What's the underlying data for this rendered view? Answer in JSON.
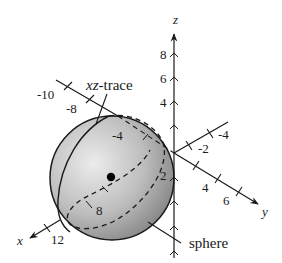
{
  "diagram": {
    "type": "3d-coordinate-sketch",
    "axes": {
      "x": {
        "label": "x",
        "ticks": [
          "-10",
          "-8",
          "-4",
          "2",
          "8",
          "12"
        ]
      },
      "y": {
        "label": "y",
        "ticks": [
          "-4",
          "-2",
          "4",
          "6"
        ]
      },
      "z": {
        "label": "z",
        "ticks": [
          "8",
          "6",
          "4"
        ]
      }
    },
    "callouts": {
      "trace": "xz-trace",
      "trace_italic": "xz",
      "trace_rest": "-trace",
      "sphere": "sphere"
    },
    "colors": {
      "sphere_light": "#e6e6e6",
      "sphere_dark": "#8a8a8a",
      "line": "#1a1a1a"
    }
  }
}
